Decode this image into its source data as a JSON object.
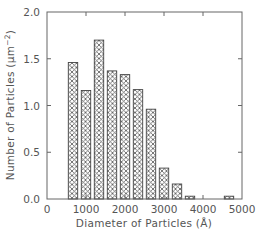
{
  "chart_data": {
    "type": "bar",
    "title": "",
    "xlabel": "Diameter of Particles (Å)",
    "ylabel": "Number of Particles (μm⁻²)",
    "ylabel_parts": {
      "main": "Number of Particles (μm",
      "sup": "−2",
      "close": ")"
    },
    "xlim": [
      0,
      5000
    ],
    "ylim": [
      0,
      2.0
    ],
    "x_ticks": [
      "0",
      "1000",
      "2000",
      "3000",
      "4000",
      "5000"
    ],
    "y_ticks": [
      "0.0",
      "0.5",
      "1.0",
      "1.5",
      "2.0"
    ],
    "grid": false,
    "legend": null,
    "bar_fill": "crosshatch",
    "bin_width": 333,
    "x": [
      667,
      1000,
      1333,
      1667,
      2000,
      2333,
      2667,
      3000,
      3333,
      3667,
      4000,
      4333,
      4667
    ],
    "values": [
      1.46,
      1.16,
      1.7,
      1.37,
      1.33,
      1.17,
      0.96,
      0.33,
      0.16,
      0.03,
      0.0,
      0.0,
      0.03
    ]
  },
  "colors": {
    "axis": "#666666",
    "bar_outline": "#444444",
    "hatch": "#555555",
    "text": "#555555"
  }
}
